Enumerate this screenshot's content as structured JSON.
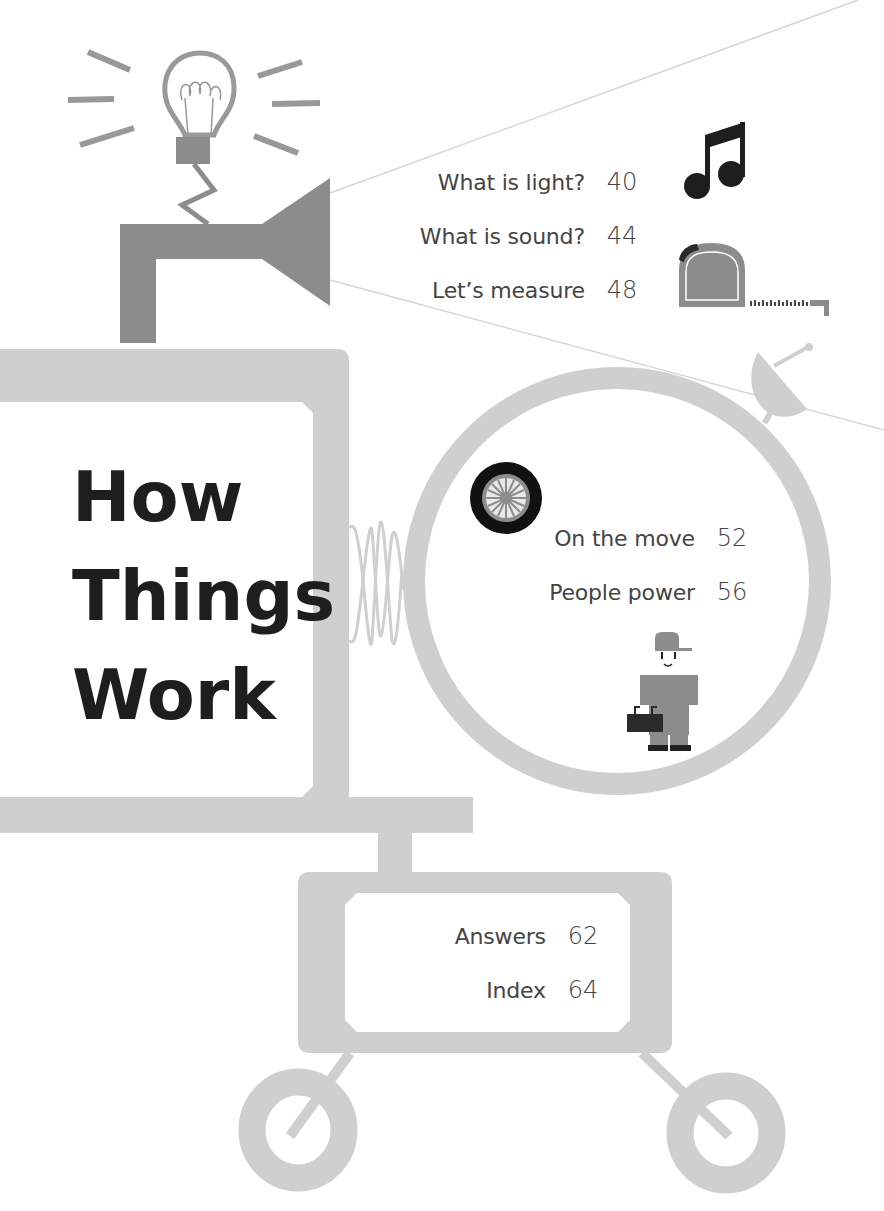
{
  "title": {
    "lines": [
      "How",
      "Things",
      "Work"
    ]
  },
  "toc": {
    "group_light_sound": [
      {
        "label": "What is light?",
        "page": "40"
      },
      {
        "label": "What is sound?",
        "page": "44"
      },
      {
        "label": "Let’s measure",
        "page": "48"
      }
    ],
    "group_motion": [
      {
        "label": "On the move",
        "page": "52"
      },
      {
        "label": "People power",
        "page": "56"
      }
    ],
    "group_back": [
      {
        "label": "Answers",
        "page": "62"
      },
      {
        "label": "Index",
        "page": "64"
      }
    ]
  },
  "icons": [
    "light-bulb-icon",
    "loudspeaker-icon",
    "music-note-icon",
    "tape-measure-icon",
    "satellite-dish-icon",
    "wheel-icon",
    "worker-icon",
    "spring-icon",
    "cart-wheel-icon"
  ],
  "colors": {
    "machine_gray": "#cfcfcf",
    "dark_gray": "#8c8c8c",
    "ink": "#1e1e1e",
    "text": "#444444",
    "line": "#d4d4d4"
  }
}
